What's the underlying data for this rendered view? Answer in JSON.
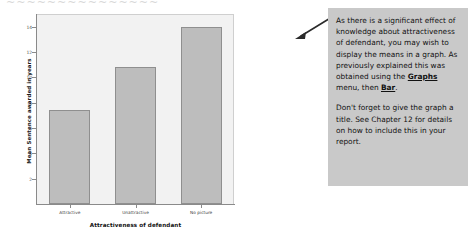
{
  "top_cut_text": "~~~~~~~~~~~~~~~",
  "chart_data": {
    "type": "bar",
    "title": "",
    "categories": [
      "Attractive",
      "Unattractive",
      "No picture"
    ],
    "values": [
      7.4,
      10.8,
      14.0
    ],
    "xlabel": "Attractiveness of defendant",
    "ylabel": "Mean Sentence awarded in years",
    "ylim": [
      0,
      15
    ],
    "yticks": [
      2,
      4,
      6,
      8,
      10,
      12,
      14
    ],
    "ytick_labels": [
      "2",
      "4",
      "6",
      "8",
      "10",
      "12",
      "14"
    ],
    "grid": false,
    "legend": false,
    "bar_color": "#bdbdbd",
    "bar_edge_color": "#8f8f8f",
    "panel_color": "#f2f2f2",
    "axis_color": "#8a8a8a"
  },
  "annotation": {
    "background": "#c9c9c9",
    "paragraph1_part1": "As there is a significant effect of knowledge about attractiveness of defendant, you may wish to display the means in a graph. As previously explained this was obtained using the ",
    "menu_graphs": "Graphs",
    "paragraph1_part2": " menu, then ",
    "menu_bar": "Bar",
    "paragraph1_part3": ".",
    "paragraph2": "Don't forget to give the graph a title. See Chapter 12 for details on how to include this in your report."
  }
}
